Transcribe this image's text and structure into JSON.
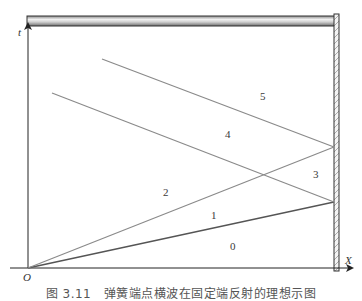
{
  "figure": {
    "axes": {
      "origin_label": "O",
      "y_axis_label": "t",
      "x_axis_label": "X"
    },
    "region_labels": [
      {
        "id": "0",
        "text": "0",
        "x": 230,
        "y": 250
      },
      {
        "id": "1",
        "text": "1",
        "x": 211,
        "y": 219
      },
      {
        "id": "2",
        "text": "2",
        "x": 163,
        "y": 196
      },
      {
        "id": "3",
        "text": "3",
        "x": 313,
        "y": 178
      },
      {
        "id": "4",
        "text": "4",
        "x": 225,
        "y": 138
      },
      {
        "id": "5",
        "text": "5",
        "x": 260,
        "y": 100
      }
    ],
    "lines": {
      "incident_lower": {
        "from": [
          28,
          268
        ],
        "to": [
          334,
          202
        ],
        "color": "#555555"
      },
      "incident_upper": {
        "from": [
          28,
          268
        ],
        "to": [
          334,
          147
        ],
        "color": "#8a8a8a"
      },
      "reflected_lower": {
        "from": [
          334,
          202
        ],
        "to": [
          52,
          93
        ],
        "color": "#8a8a8a"
      },
      "reflected_upper": {
        "from": [
          334,
          147
        ],
        "to": [
          102,
          59
        ],
        "color": "#8a8a8a"
      }
    },
    "colors": {
      "bar_fill_light": "#e6e6e6",
      "bar_fill_dark": "#9a9a9a",
      "wall_stroke": "#333333",
      "axis": "#222222"
    }
  },
  "caption": {
    "text": "图 3.11　弹簧端点横波在固定端反射的理想示图"
  }
}
